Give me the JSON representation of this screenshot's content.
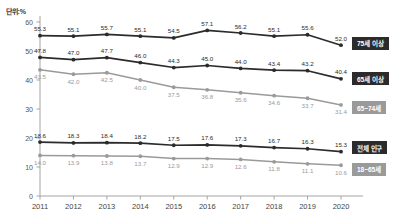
{
  "unit_label": "단위:%",
  "legend": [
    {
      "name": "legend-75-plus",
      "label": "75세 이상",
      "color": "#2b2b2b"
    },
    {
      "name": "legend-65-plus",
      "label": "65세 이상",
      "color": "#2b2b2b"
    },
    {
      "name": "legend-65-74",
      "label": "65~74세",
      "color": "#9a9a9a"
    },
    {
      "name": "legend-total-pop",
      "label": "전체 인구",
      "color": "#2b2b2b"
    },
    {
      "name": "legend-18-65",
      "label": "18~65세",
      "color": "#9a9a9a"
    }
  ],
  "chart_data": {
    "type": "line",
    "title": "",
    "xlabel": "",
    "ylabel": "단위:%",
    "ylim": [
      0,
      60
    ],
    "yticks": [
      "0",
      "10",
      "20",
      "30",
      "40",
      "50",
      "60"
    ],
    "grid": false,
    "legend_position": "right",
    "categories": [
      "2011",
      "2012",
      "2013",
      "2014",
      "2015",
      "2016",
      "2017",
      "2018",
      "2019",
      "2020"
    ],
    "series": [
      {
        "name": "75세 이상",
        "color": "#2b2b2b",
        "label_color": "#2b2b2b",
        "values": [
          55.3,
          55.1,
          55.7,
          55.1,
          54.5,
          57.1,
          56.2,
          55.1,
          55.6,
          52.0
        ],
        "labels": [
          "55.3",
          "55.1",
          "55.7",
          "55.1",
          "54.5",
          "57.1",
          "56.2",
          "55.1",
          "55.6",
          "52.0"
        ]
      },
      {
        "name": "65세 이상",
        "color": "#2b2b2b",
        "label_color": "#2b2b2b",
        "values": [
          47.8,
          47.0,
          47.7,
          46.0,
          44.3,
          45.0,
          44.0,
          43.4,
          43.2,
          40.4
        ],
        "labels": [
          "47.8",
          "47.0",
          "47.7",
          "46.0",
          "44.3",
          "45.0",
          "44.0",
          "43.4",
          "43.2",
          "40.4"
        ]
      },
      {
        "name": "65~74세",
        "color": "#9a9a9a",
        "label_color": "#9a9a9a",
        "values": [
          43.5,
          42.0,
          42.5,
          40.0,
          37.5,
          36.6,
          35.6,
          34.6,
          33.7,
          31.4
        ],
        "labels": [
          "43.5",
          "42.0",
          "42.5",
          "40.0",
          "37.5",
          "36.8",
          "35.6",
          "34.6",
          "33.7",
          "31.4"
        ]
      },
      {
        "name": "전체 인구",
        "color": "#2b2b2b",
        "label_color": "#2b2b2b",
        "values": [
          18.6,
          18.3,
          18.4,
          18.2,
          17.5,
          17.6,
          17.3,
          16.7,
          16.3,
          15.3
        ],
        "labels": [
          "18.6",
          "18.3",
          "18.4",
          "18.2",
          "17.5",
          "17.6",
          "17.3",
          "16.7",
          "16.3",
          "15.3"
        ]
      },
      {
        "name": "18~65세",
        "color": "#9a9a9a",
        "label_color": "#9a9a9a",
        "values": [
          14.0,
          13.9,
          13.8,
          13.7,
          12.9,
          12.9,
          12.6,
          11.8,
          11.1,
          10.6
        ],
        "labels": [
          "14.0",
          "13.9",
          "13.8",
          "13.7",
          "12.9",
          "12.9",
          "12.6",
          "11.8",
          "11.1",
          "10.6"
        ]
      }
    ]
  }
}
